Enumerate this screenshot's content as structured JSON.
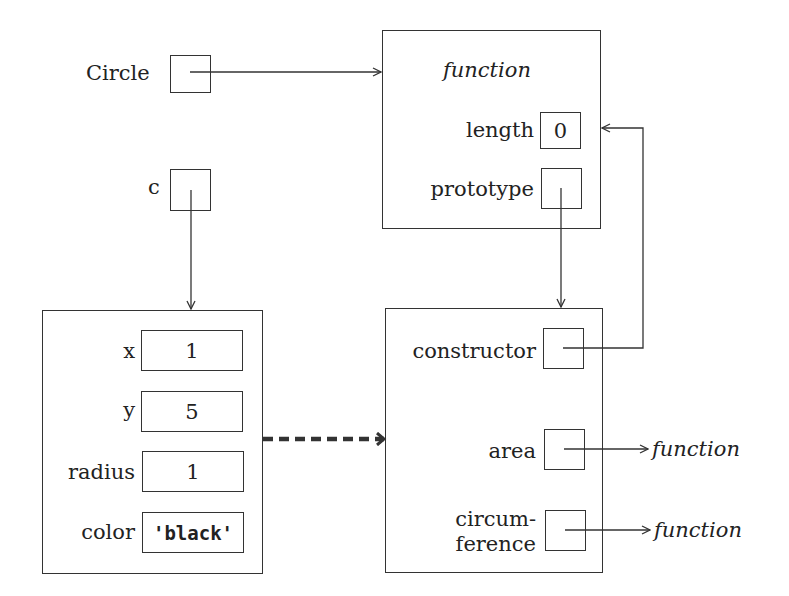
{
  "variables": {
    "circle": {
      "label": "Circle"
    },
    "c": {
      "label": "c"
    }
  },
  "function_object": {
    "title": "function",
    "length_label": "length",
    "length_value": "0",
    "prototype_label": "prototype"
  },
  "instance_object": {
    "fields": [
      {
        "label": "x",
        "value": "1"
      },
      {
        "label": "y",
        "value": "5"
      },
      {
        "label": "radius",
        "value": "1"
      },
      {
        "label": "color",
        "value": "'black'"
      }
    ]
  },
  "prototype_object": {
    "constructor_label": "constructor",
    "area_label": "area",
    "circumference_label_line1": "circum-",
    "circumference_label_line2": "ference",
    "area_target": "function",
    "circumference_target": "function"
  },
  "colors": {
    "stroke": "#333333",
    "background": "#ffffff"
  }
}
